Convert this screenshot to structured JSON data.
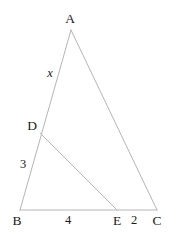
{
  "figure": {
    "width": 177,
    "height": 234,
    "background_color": "#ffffff",
    "stroke_color": "#b5b5b5",
    "text_color": "#1a1a1a",
    "stroke_width": 1
  },
  "vertices": {
    "A": {
      "label": "A",
      "x": 71,
      "y": 30,
      "label_x": 70,
      "label_y": 19
    },
    "B": {
      "label": "B",
      "x": 20,
      "y": 210,
      "label_x": 17,
      "label_y": 221
    },
    "C": {
      "label": "C",
      "x": 157,
      "y": 210,
      "label_x": 157,
      "label_y": 221
    },
    "D": {
      "label": "D",
      "x": 40,
      "y": 133,
      "label_x": 32,
      "label_y": 126
    },
    "E": {
      "label": "E",
      "x": 117,
      "y": 210,
      "label_x": 117,
      "label_y": 221
    }
  },
  "segments": [
    {
      "name": "side-AB",
      "from": "A",
      "to": "B"
    },
    {
      "name": "side-AC",
      "from": "A",
      "to": "C"
    },
    {
      "name": "side-BC",
      "from": "B",
      "to": "C"
    },
    {
      "name": "segment-DE",
      "from": "D",
      "to": "E"
    }
  ],
  "measure_labels": {
    "AD": {
      "text": "x",
      "x": 50,
      "y": 73,
      "italic": true
    },
    "DB": {
      "text": "3",
      "x": 23,
      "y": 164,
      "italic": false
    },
    "BE": {
      "text": "4",
      "x": 68,
      "y": 220,
      "italic": false
    },
    "EC": {
      "text": "2",
      "x": 134,
      "y": 220,
      "italic": false
    }
  },
  "chart_data": {
    "type": "diagram",
    "points": [
      {
        "name": "A",
        "x": 71,
        "y": 30
      },
      {
        "name": "B",
        "x": 20,
        "y": 210
      },
      {
        "name": "C",
        "x": 157,
        "y": 210
      },
      {
        "name": "D",
        "x": 40,
        "y": 133
      },
      {
        "name": "E",
        "x": 117,
        "y": 210
      }
    ],
    "edges": [
      {
        "from": "A",
        "to": "B",
        "label": "",
        "parts": [
          "x",
          "3"
        ]
      },
      {
        "from": "A",
        "to": "C",
        "label": ""
      },
      {
        "from": "B",
        "to": "C",
        "label": "",
        "parts": [
          "4",
          "2"
        ]
      },
      {
        "from": "D",
        "to": "E",
        "label": ""
      }
    ],
    "annotations": [
      {
        "on": "AD",
        "value": "x"
      },
      {
        "on": "DB",
        "value": "3"
      },
      {
        "on": "BE",
        "value": "4"
      },
      {
        "on": "EC",
        "value": "2"
      }
    ]
  }
}
